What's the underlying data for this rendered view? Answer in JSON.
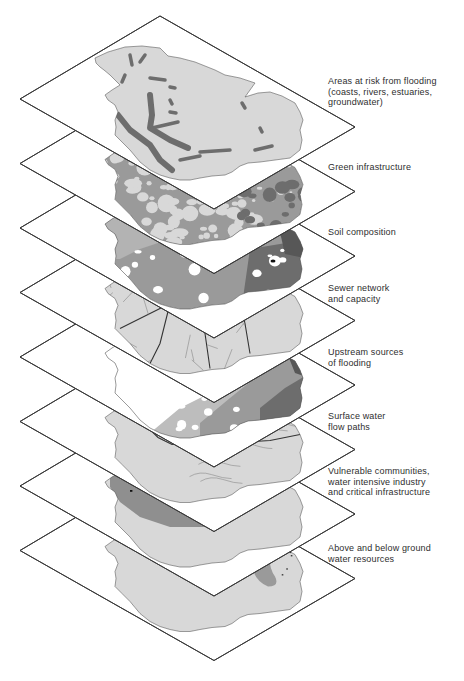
{
  "diagram": {
    "colors": {
      "outline": "#3a3a3a",
      "plane": "#ffffff",
      "land_light": "#d8d8d8",
      "land_mid": "#9a9a9a",
      "land_dark": "#6d6d6d",
      "land_darker": "#575757",
      "text": "#2e2e2e"
    },
    "layers": [
      {
        "id": "flood-risk",
        "label_lines": [
          "Areas at risk from flooding",
          "(coasts, rivers, estuaries,",
          "groundwater)"
        ],
        "label_top": 76,
        "style": "flood"
      },
      {
        "id": "green-infrastructure",
        "label_lines": [
          "Green infrastructure"
        ],
        "label_top": 162,
        "style": "green"
      },
      {
        "id": "soil-composition",
        "label_lines": [
          "Soil composition"
        ],
        "label_top": 227,
        "style": "soil"
      },
      {
        "id": "sewer-network",
        "label_lines": [
          "Sewer network",
          "and capacity"
        ],
        "label_top": 283,
        "style": "sewer"
      },
      {
        "id": "upstream-sources",
        "label_lines": [
          "Upstream sources",
          "of flooding"
        ],
        "label_top": 347,
        "style": "upstream"
      },
      {
        "id": "surface-water",
        "label_lines": [
          "Surface water",
          "flow paths"
        ],
        "label_top": 411,
        "style": "surface"
      },
      {
        "id": "vulnerable-communities",
        "label_lines": [
          "Vulnerable communities,",
          "water intensive industry",
          "and critical infrastructure"
        ],
        "label_top": 466,
        "style": "vulnerable"
      },
      {
        "id": "water-resources",
        "label_lines": [
          "Above and below ground",
          "water resources"
        ],
        "label_top": 543,
        "style": "water"
      }
    ]
  }
}
